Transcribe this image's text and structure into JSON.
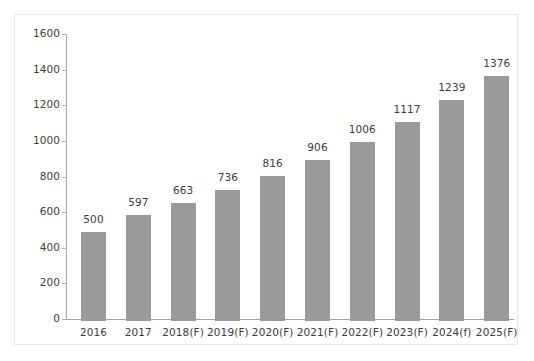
{
  "chart_data": {
    "type": "bar",
    "title": "",
    "subtitle": "",
    "xlabel": "",
    "ylabel": "",
    "ylim": [
      0,
      1600
    ],
    "ytick_step": 200,
    "yticks": [
      1600,
      1400,
      1200,
      1000,
      800,
      600,
      400,
      200,
      0
    ],
    "ytick_labels": [
      "1600",
      "1400",
      "1200",
      "1000",
      "800",
      "600",
      "400",
      "200",
      "0"
    ],
    "grid": false,
    "legend": null,
    "categories": [
      "2016",
      "2017",
      "2018(F)",
      "2019(F)",
      "2020(F)",
      "2021(F)",
      "2022(F)",
      "2023(F)",
      "2024(f)",
      "2025(F)"
    ],
    "values": [
      500,
      597,
      663,
      736,
      816,
      906,
      1006,
      1117,
      1239,
      1376
    ],
    "value_labels": [
      "500",
      "597",
      "663",
      "736",
      "816",
      "906",
      "1006",
      "1117",
      "1239",
      "1376"
    ],
    "series": [
      {
        "name": "",
        "values": [
          500,
          597,
          663,
          736,
          816,
          906,
          1006,
          1117,
          1239,
          1376
        ]
      }
    ],
    "annotations": []
  },
  "colors": {
    "bar_fill": "#9a9a9a",
    "text": "#3c3c3c",
    "axis_line": "#a9a9a9",
    "baseline": "#a3a3a3",
    "tick_mark": "#b0b0b0",
    "frame_border": "#e7e7e7",
    "background": "#ffffff"
  }
}
